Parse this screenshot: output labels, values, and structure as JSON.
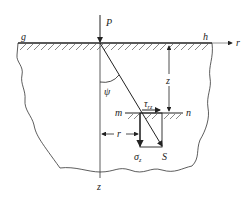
{
  "diagram": {
    "labels": {
      "load": "P",
      "left_surface_point": "g",
      "right_surface_point": "h",
      "radial_axis": "r",
      "depth_axis": "z",
      "angle": "ψ",
      "depth_dimension": "z",
      "radial_dimension": "r",
      "plane_left": "m",
      "plane_right": "n",
      "shear_stress": "τ",
      "shear_stress_sub": "rz",
      "normal_stress": "σ",
      "normal_stress_sub": "z",
      "resultant_stress": "S"
    },
    "colors": {
      "line": "#222222",
      "hatch": "#555555",
      "axis": "#777777"
    }
  }
}
